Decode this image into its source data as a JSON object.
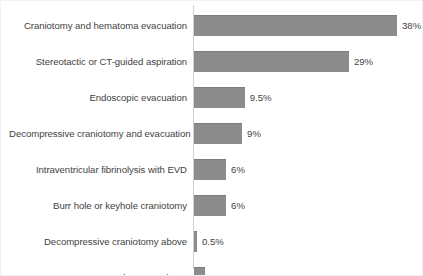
{
  "chart_data": {
    "type": "bar",
    "orientation": "horizontal",
    "title": "",
    "subtitle": "",
    "xlabel": "",
    "ylabel": "",
    "grid": false,
    "legend": false,
    "legend_position": "none",
    "axis_line": "category-axis-vertical",
    "xlim": [
      0,
      38
    ],
    "bar_color": "#8c8c8c",
    "text_color": "#3f3f3f",
    "background_color": "#ffffff",
    "border_color": "#f2f2f2",
    "categories": [
      "Craniotomy and hematoma evacuation",
      "Stereotactic or CT-guided aspiration",
      "Endoscopic evacuation",
      "Decompressive craniotomy and evacuation",
      "Intraventricular fibrinolysis with EVD",
      "Burr hole or keyhole craniotomy",
      "Decompressive craniotomy above",
      "Other procedures"
    ],
    "values": [
      38,
      29,
      9.5,
      9,
      6,
      6,
      0.5,
      2
    ],
    "value_labels": [
      "38%",
      "29%",
      "9.5%",
      "9%",
      "6%",
      "6%",
      "0.5%",
      "2%"
    ]
  }
}
